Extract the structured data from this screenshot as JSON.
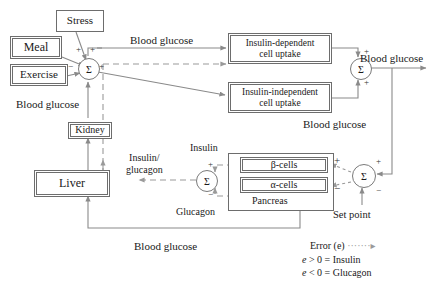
{
  "diagram": {
    "line_color": "#8a8a8a",
    "box_color": "#6d6d6d",
    "nodes": {
      "stress": "Stress",
      "meal": "Meal",
      "exercise": "Exercise",
      "kidney": "Kidney",
      "liver": "Liver",
      "insulin_dependent": "Insulin-dependent\ncell uptake",
      "insulin_dependent_l1": "Insulin-dependent",
      "insulin_dependent_l2": "cell uptake",
      "insulin_independent_l1": "Insulin-independent",
      "insulin_independent_l2": "cell uptake",
      "beta_cells": "β-cells",
      "alpha_cells": "α-cells",
      "pancreas": "Pancreas"
    },
    "sums": {
      "sigma": "Σ",
      "left": "Σ",
      "top_right": "Σ",
      "mid": "Σ",
      "bottom_right": "Σ"
    },
    "edge_labels": {
      "blood_glucose_top": "Blood glucose",
      "blood_glucose_out": "Blood glucose",
      "blood_glucose_left": "Blood glucose",
      "blood_glucose_mid": "Blood glucose",
      "blood_glucose_bottom": "Blood glucose",
      "insulin_glucagon_l1": "Insulin/",
      "insulin_glucagon_l2": "glucagon",
      "insulin": "Insulin",
      "glucagon": "Glucagon",
      "set_point": "Set point"
    },
    "signs": {
      "plus": "+",
      "minus": "−",
      "left_sum_plus_stress": "+",
      "left_sum_plus_meal": "+",
      "left_sum_minus_exercise": "−",
      "left_sum_plus_out": "+",
      "top_sum_plus_a": "+",
      "top_sum_plus_b": "+",
      "mid_sum_plus": "+",
      "mid_sum_minus": "−",
      "br_sum_plus_beta": "+",
      "br_sum_minus_alpha": "−",
      "br_sum_plus_fb": "+",
      "br_sum_minus_sp": "−"
    },
    "legend": {
      "error_label": "Error (e)",
      "error_arrow": "·······▸",
      "line1_e": "e",
      "line1_rest": "> 0 = Insulin",
      "line2_e": "e",
      "line2_rest": "< 0 = Glucagon"
    }
  }
}
